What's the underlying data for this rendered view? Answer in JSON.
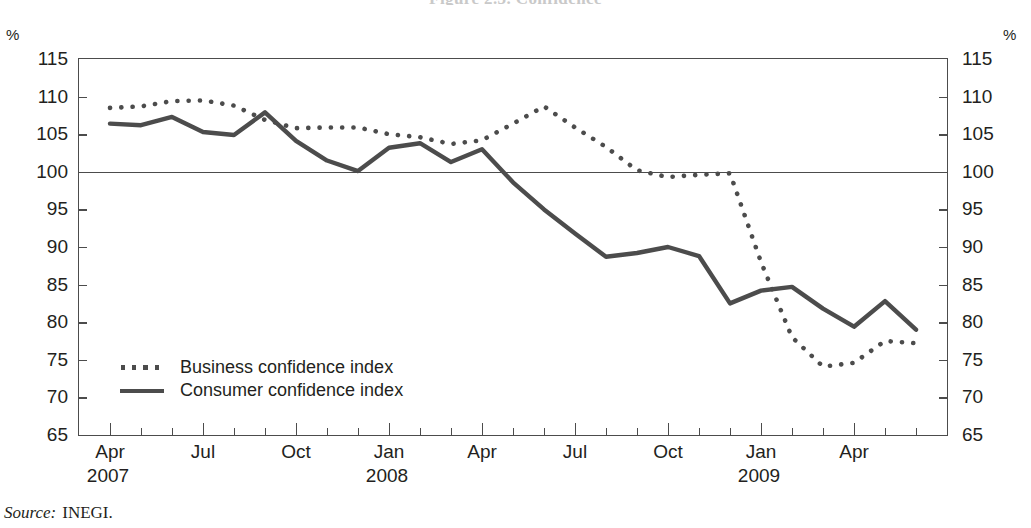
{
  "figure": {
    "title_clipped": "Figure 2.3.  Confidence",
    "unit_left": "%",
    "unit_right": "%",
    "source_key": "Source:",
    "source_value": "INEGI."
  },
  "legend": {
    "position": "inside-lower-left",
    "entries": [
      {
        "label": "Business confidence index",
        "style": "dotted",
        "color": "#4c4c4c"
      },
      {
        "label": "Consumer confidence index",
        "style": "solid",
        "color": "#4c4c4c"
      }
    ]
  },
  "axis": {
    "y_ticks": [
      65,
      70,
      75,
      80,
      85,
      90,
      95,
      100,
      105,
      110,
      115
    ],
    "y_min": 65,
    "y_max": 115,
    "reference_value": 100,
    "x_major_labels": [
      {
        "label": "Apr",
        "year": "2007",
        "index": 0
      },
      {
        "label": "Jul",
        "year": "",
        "index": 3
      },
      {
        "label": "Oct",
        "year": "",
        "index": 6
      },
      {
        "label": "Jan",
        "year": "2008",
        "index": 9
      },
      {
        "label": "Apr",
        "year": "",
        "index": 12
      },
      {
        "label": "Jul",
        "year": "",
        "index": 15
      },
      {
        "label": "Oct",
        "year": "",
        "index": 18
      },
      {
        "label": "Jan",
        "year": "2009",
        "index": 21
      },
      {
        "label": "Apr",
        "year": "",
        "index": 24
      }
    ]
  },
  "chart_data": {
    "type": "line",
    "title": "Figure 2.3.  Confidence",
    "xlabel": "",
    "ylabel": "%",
    "ylim": [
      65,
      115
    ],
    "grid": false,
    "reference_line": {
      "value": 100,
      "color": "#4c4c4c"
    },
    "legend_position": "inside-lower-left",
    "x": [
      "Apr 2007",
      "May 2007",
      "Jun 2007",
      "Jul 2007",
      "Aug 2007",
      "Sep 2007",
      "Oct 2007",
      "Nov 2007",
      "Dec 2007",
      "Jan 2008",
      "Feb 2008",
      "Mar 2008",
      "Apr 2008",
      "May 2008",
      "Jun 2008",
      "Jul 2008",
      "Aug 2008",
      "Sep 2008",
      "Oct 2008",
      "Nov 2008",
      "Dec 2008",
      "Jan 2009",
      "Feb 2009",
      "Mar 2009",
      "Apr 2009",
      "May 2009",
      "Jun 2009"
    ],
    "series": [
      {
        "name": "Business confidence index",
        "style": "dotted",
        "color": "#4c4c4c",
        "values": [
          108.5,
          108.7,
          109.4,
          109.5,
          108.8,
          106.9,
          105.8,
          105.9,
          105.9,
          105.0,
          104.6,
          103.7,
          104.2,
          106.4,
          108.7,
          105.9,
          103.3,
          100.2,
          99.3,
          99.6,
          99.8,
          88.0,
          78.0,
          74.1,
          74.6,
          77.5,
          77.2
        ]
      },
      {
        "name": "Consumer confidence index",
        "style": "solid",
        "color": "#4c4c4c",
        "values": [
          106.4,
          106.2,
          107.3,
          105.3,
          104.9,
          107.9,
          104.1,
          101.5,
          100.1,
          103.2,
          103.8,
          101.3,
          103.0,
          98.6,
          95.0,
          91.8,
          88.7,
          89.2,
          90.0,
          88.8,
          82.5,
          84.2,
          84.7,
          81.8,
          79.4,
          82.8,
          79.0
        ]
      }
    ],
    "series_tail": [
      {
        "name": "Business confidence index",
        "values_extra": [
          86.7,
          84.2
        ]
      },
      {
        "name": "Consumer confidence index",
        "values_extra": [
          82.8,
          79.0
        ]
      }
    ]
  }
}
